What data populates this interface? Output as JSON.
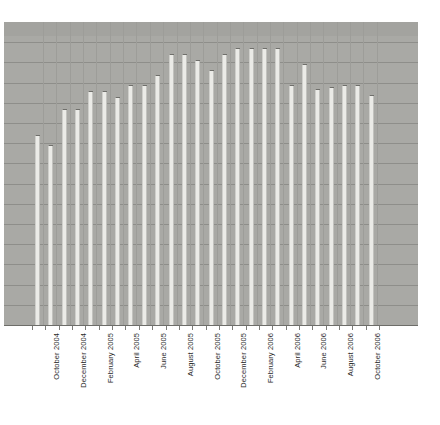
{
  "chart_data": {
    "type": "bar",
    "title": "",
    "subtitle": "",
    "xlabel": "",
    "ylabel": "",
    "grid": true,
    "legend": null,
    "ylim": [
      0,
      15
    ],
    "gridline_count": 14,
    "categories": [
      "September 2004",
      "October 2004",
      "November 2004",
      "December 2004",
      "January 2005",
      "February 2005",
      "March 2005",
      "April 2005",
      "May 2005",
      "June 2005",
      "July 2005",
      "August 2005",
      "September 2005",
      "October 2005",
      "November 2005",
      "December 2005",
      "January 2006",
      "February 2006",
      "March 2006",
      "April 2006",
      "May 2006",
      "June 2006",
      "July 2006",
      "August 2006",
      "September 2006",
      "October 2006"
    ],
    "tick_labels": [
      "",
      "October 2004",
      "",
      "December 2004",
      "",
      "February 2005",
      "",
      "April 2005",
      "",
      "June 2005",
      "",
      "August 2005",
      "",
      "October 2005",
      "",
      "December 2005",
      "",
      "February 2006",
      "",
      "April 2006",
      "",
      "June 2006",
      "",
      "August 2006",
      "",
      "October 2006"
    ],
    "values": [
      9.4,
      8.9,
      10.7,
      10.7,
      11.6,
      11.6,
      11.3,
      11.9,
      11.9,
      12.4,
      13.4,
      13.4,
      13.1,
      12.6,
      13.4,
      13.7,
      13.7,
      13.7,
      13.7,
      11.9,
      12.9,
      11.7,
      11.8,
      11.9,
      11.9,
      11.4
    ],
    "value_max": 15,
    "colors": {
      "plot_background": "#a9a9a5",
      "bar_fill": "#ebebe7",
      "bar_edge": "#6f6f6b",
      "gridline": "#8e8e8a",
      "axis": "#6d6d69",
      "label_text": "#2b2b2b",
      "page_background": "#ffffff"
    }
  }
}
